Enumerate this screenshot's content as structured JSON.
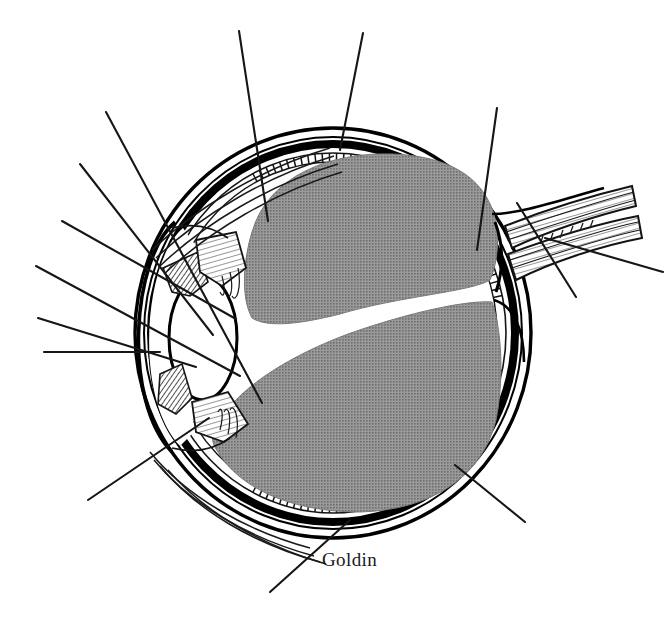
{
  "figure": {
    "domain": "Diagram",
    "kind": "anatomical-illustration",
    "orientation": "anterior structures at left, optic nerve exiting to the right",
    "signature": "Goldin",
    "label_count_visible": 0,
    "note_on_labels": "All leader lines radiate outward to blank space; no label text is printed in the image."
  },
  "canvas": {
    "width": 666,
    "height": 632,
    "background": "#ffffff"
  },
  "palette": {
    "ink": "#141414",
    "outline": "#000000",
    "vitreous_gray": "#8a8a8a",
    "vitreous_gray_edge": "#7e7e7e",
    "paper_white": "#ffffff",
    "hatch_ink": "#1a1a1a",
    "leader_line": "#161616"
  },
  "structures": [
    {
      "id": "sclera",
      "name": "sclera",
      "render": "outer thin double-line shell of the globe",
      "fill": "#ffffff",
      "stroke": "#000000"
    },
    {
      "id": "choroid",
      "name": "choroid",
      "render": "thick solid black band just inside the sclera",
      "fill": "#000000"
    },
    {
      "id": "retina",
      "name": "retina",
      "render": "hatched tick-marked band lining the inner choroid",
      "fill": "#ffffff",
      "stroke": "#141414"
    },
    {
      "id": "vitreous-body",
      "name": "vitreous body",
      "render": "large halftone-gray mass filling the posterior globe, split by a white diagonal cleft",
      "fill": "#8a8a8a"
    },
    {
      "id": "cornea",
      "name": "cornea",
      "render": "clear double-curved dome at the far left of the globe",
      "fill": "#ffffff",
      "stroke": "#000000"
    },
    {
      "id": "anterior-chamber",
      "name": "anterior chamber",
      "render": "white space between cornea and iris/lens",
      "fill": "#ffffff"
    },
    {
      "id": "iris",
      "name": "iris",
      "render": "diagonally hatched wedge above and below the lens aperture",
      "fill": "#ffffff",
      "stroke": "#141414"
    },
    {
      "id": "lens",
      "name": "lens",
      "render": "white biconvex ellipse behind the iris",
      "fill": "#ffffff",
      "stroke": "#000000"
    },
    {
      "id": "ciliary-body",
      "name": "ciliary body",
      "render": "striated triangular masses at the top and bottom lens margins",
      "fill": "#ffffff",
      "stroke": "#141414"
    },
    {
      "id": "suspensory-ligament",
      "name": "suspensory ligament / zonule fibers",
      "render": "fine fanned fiber strokes from ciliary body to lens equator",
      "stroke": "#141414"
    },
    {
      "id": "optic-nerve",
      "name": "optic nerve",
      "render": "striated tapering cable leaving the posterior globe toward the upper right",
      "fill": "#ffffff",
      "stroke": "#141414"
    },
    {
      "id": "optic-disc",
      "name": "optic disc",
      "render": "junction where the nerve meets the retina on the posterior wall",
      "fill": "#ffffff"
    },
    {
      "id": "extraocular-muscle",
      "name": "extraocular muscle insertion",
      "render": "tapered fiber bundles sweeping along the outer sclera at the upper-left and lower-left",
      "stroke": "#141414"
    }
  ],
  "leader_lines": [
    {
      "id": "leader-superior-vitreous",
      "from": [
        239,
        31
      ],
      "to": [
        268,
        221
      ],
      "points_to": "vitreous body"
    },
    {
      "id": "leader-superior-sclera",
      "from": [
        363,
        33
      ],
      "to": [
        340,
        150
      ],
      "points_to": "sclera / retina at superior pole"
    },
    {
      "id": "leader-superior-rightwall",
      "from": [
        497,
        108
      ],
      "to": [
        477,
        250
      ],
      "points_to": "posterior wall near optic disc"
    },
    {
      "id": "leader-upper-left-muscle",
      "from": [
        106,
        112
      ],
      "to": [
        262,
        403
      ],
      "points_to": "superior extraocular muscle / iris"
    },
    {
      "id": "leader-left-cornea-a",
      "from": [
        80,
        164
      ],
      "to": [
        213,
        335
      ],
      "points_to": "cornea"
    },
    {
      "id": "leader-left-cornea-b",
      "from": [
        62,
        221
      ],
      "to": [
        236,
        319
      ],
      "points_to": "anterior chamber"
    },
    {
      "id": "leader-left-lens",
      "from": [
        36,
        266
      ],
      "to": [
        240,
        376
      ],
      "points_to": "lens"
    },
    {
      "id": "leader-left-iris",
      "from": [
        38,
        318
      ],
      "to": [
        196,
        367
      ],
      "points_to": "iris"
    },
    {
      "id": "leader-left-sclera",
      "from": [
        44,
        352
      ],
      "to": [
        160,
        352
      ],
      "points_to": "sclera at the limbus"
    },
    {
      "id": "leader-lower-left-ciliary",
      "from": [
        88,
        500
      ],
      "to": [
        209,
        418
      ],
      "points_to": "ciliary body / inferior muscle"
    },
    {
      "id": "leader-bottom-retina",
      "from": [
        270,
        592
      ],
      "to": [
        350,
        520
      ],
      "points_to": "retina at inferior wall"
    },
    {
      "id": "leader-bottom-right",
      "from": [
        525,
        522
      ],
      "to": [
        455,
        465
      ],
      "points_to": "choroid at inferior-posterior wall"
    },
    {
      "id": "leader-right-nerve-a",
      "from": [
        663,
        272
      ],
      "to": [
        545,
        238
      ],
      "points_to": "optic nerve sheath"
    },
    {
      "id": "leader-right-nerve-b",
      "from": [
        576,
        297
      ],
      "to": [
        517,
        203
      ],
      "points_to": "optic nerve fibers"
    }
  ]
}
